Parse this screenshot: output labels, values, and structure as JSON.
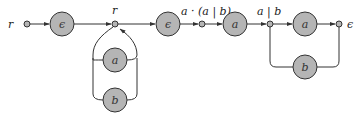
{
  "diagram": {
    "type": "regex-nfa-construction",
    "start_label": "r",
    "junctions": [
      {
        "id": "j_start",
        "label": "",
        "x": 27,
        "y": 24
      },
      {
        "id": "j_r",
        "label": "r",
        "x": 115,
        "y": 24
      },
      {
        "id": "j_aab",
        "label": "a · (a | b)",
        "x": 202,
        "y": 24
      },
      {
        "id": "j_ab",
        "label": "a | b",
        "x": 270,
        "y": 24
      },
      {
        "id": "j_end",
        "label": "ϵ",
        "x": 339,
        "y": 24
      }
    ],
    "states": [
      {
        "id": "s_eps1",
        "symbol": "ϵ",
        "x": 62,
        "y": 24
      },
      {
        "id": "s_loop_a",
        "symbol": "a",
        "x": 115,
        "y": 60
      },
      {
        "id": "s_loop_b",
        "symbol": "b",
        "x": 115,
        "y": 100
      },
      {
        "id": "s_eps2",
        "symbol": "ϵ",
        "x": 168,
        "y": 24
      },
      {
        "id": "s_a1",
        "symbol": "a",
        "x": 235,
        "y": 24
      },
      {
        "id": "s_a2",
        "symbol": "a",
        "x": 305,
        "y": 24
      },
      {
        "id": "s_b2",
        "symbol": "b",
        "x": 305,
        "y": 67
      }
    ],
    "edges": [
      {
        "from": "j_start",
        "to": "s_eps1"
      },
      {
        "from": "s_eps1",
        "to": "j_r"
      },
      {
        "from": "j_r",
        "to": "s_loop_a",
        "kind": "loop"
      },
      {
        "from": "j_r",
        "to": "s_loop_b",
        "kind": "loop"
      },
      {
        "from": "j_r",
        "to": "s_eps2"
      },
      {
        "from": "s_eps2",
        "to": "j_aab"
      },
      {
        "from": "j_aab",
        "to": "s_a1"
      },
      {
        "from": "s_a1",
        "to": "j_ab"
      },
      {
        "from": "j_ab",
        "to": "s_a2"
      },
      {
        "from": "s_a2",
        "to": "j_end"
      },
      {
        "from": "j_ab",
        "to": "s_b2",
        "kind": "branch"
      },
      {
        "from": "s_b2",
        "to": "j_end",
        "kind": "branch"
      }
    ],
    "colors": {
      "node_fill": "#b5b5b5",
      "stroke": "#333333",
      "background": "#ffffff"
    }
  }
}
